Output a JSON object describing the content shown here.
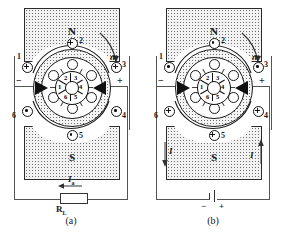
{
  "figure": {
    "panels": [
      {
        "id": "a",
        "caption": "(a)",
        "mode": "generator",
        "poles": {
          "top": "N",
          "bottom": "S"
        },
        "rotation_label": "n",
        "terminals": {
          "left": "−",
          "right": "+"
        },
        "commutator_segments": [
          "1",
          "2",
          "3",
          "4",
          "5",
          "6"
        ],
        "conductors": [
          {
            "label": "1",
            "symbol": "cross",
            "position": "upper-left"
          },
          {
            "label": "2",
            "symbol": "cross",
            "position": "top"
          },
          {
            "label": "3",
            "symbol": "cross",
            "position": "upper-right"
          },
          {
            "label": "4",
            "symbol": "dot",
            "position": "lower-right"
          },
          {
            "label": "5",
            "symbol": "dot",
            "position": "bottom"
          },
          {
            "label": "6",
            "symbol": "dot",
            "position": "lower-left"
          }
        ],
        "external_element": {
          "type": "resistor",
          "label": "R",
          "sub": "L"
        },
        "current_label": {
          "text": "I",
          "sub": "a",
          "direction": "left"
        }
      },
      {
        "id": "b",
        "caption": "(b)",
        "mode": "motor",
        "poles": {
          "top": "N",
          "bottom": "S"
        },
        "rotation_label": "n",
        "terminals": {
          "left": "−",
          "right": "+"
        },
        "commutator_segments": [
          "1",
          "2",
          "3",
          "4",
          "5",
          "6"
        ],
        "conductors": [
          {
            "label": "1",
            "symbol": "dot",
            "position": "upper-left"
          },
          {
            "label": "2",
            "symbol": "dot",
            "position": "top"
          },
          {
            "label": "3",
            "symbol": "dot",
            "position": "upper-right"
          },
          {
            "label": "4",
            "symbol": "cross",
            "position": "lower-right"
          },
          {
            "label": "5",
            "symbol": "cross",
            "position": "bottom"
          },
          {
            "label": "6",
            "symbol": "cross",
            "position": "lower-left"
          }
        ],
        "external_element": {
          "type": "battery",
          "minus": "−",
          "plus": "+"
        },
        "current_labels": [
          {
            "text": "I",
            "side": "left",
            "direction": "down"
          },
          {
            "text": "I",
            "side": "right",
            "direction": "up"
          }
        ]
      }
    ],
    "colors": {
      "ink": "#1a1a1a",
      "wire": "#555555",
      "brush": "#111111",
      "pole_fill": "#f2f2f2",
      "stipple": "#6e6e6e"
    }
  }
}
